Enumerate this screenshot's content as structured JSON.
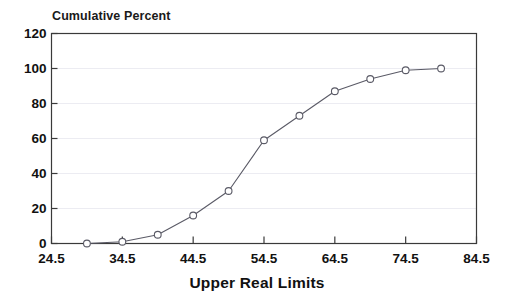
{
  "chart_data": {
    "type": "line",
    "title": "Cumulative Percent",
    "subtitle": "",
    "xlabel": "Upper Real Limits",
    "ylabel": "",
    "x": [
      29.5,
      34.5,
      39.5,
      44.5,
      49.5,
      54.5,
      59.5,
      64.5,
      69.5,
      74.5,
      79.5
    ],
    "values": [
      0,
      1,
      5,
      16,
      30,
      59,
      73,
      87,
      94,
      99,
      100
    ],
    "series": [
      {
        "name": "Cumulative Percent",
        "values": [
          0,
          1,
          5,
          16,
          30,
          59,
          73,
          87,
          94,
          99,
          100
        ]
      }
    ],
    "xlim": [
      24.5,
      84.5
    ],
    "ylim": [
      0,
      120
    ],
    "xticks": [
      24.5,
      34.5,
      44.5,
      54.5,
      64.5,
      74.5,
      84.5
    ],
    "xtick_labels": [
      "24.5",
      "34.5",
      "44.5",
      "54.5",
      "64.5",
      "74.5",
      "84.5"
    ],
    "yticks": [
      0,
      20,
      40,
      60,
      80,
      100,
      120
    ],
    "ytick_labels": [
      "0",
      "20",
      "40",
      "60",
      "80",
      "100",
      "120"
    ],
    "grid": true,
    "grid_axis": "y",
    "legend": false,
    "legend_position": "none",
    "marker": "circle-open",
    "line_color": "#5a5a66",
    "marker_color": "#5a5a66",
    "grid_color": "#ececf2",
    "axis_color": "#3a3a3a",
    "background_color": "#ffffff",
    "annotations": []
  }
}
